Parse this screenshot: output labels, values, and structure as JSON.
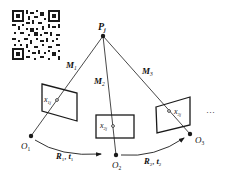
{
  "diagram": {
    "type": "multi-view-geometry",
    "point": {
      "label": "P",
      "sub": "j"
    },
    "projection_labels": [
      {
        "label": "M",
        "sub": "1"
      },
      {
        "label": "M",
        "sub": "2"
      },
      {
        "label": "M",
        "sub": "3"
      }
    ],
    "cameras": [
      {
        "label": "O",
        "sub": "1"
      },
      {
        "label": "O",
        "sub": "2"
      },
      {
        "label": "O",
        "sub": "3"
      }
    ],
    "image_points": [
      {
        "label": "x",
        "sub": "1j"
      },
      {
        "label": "x",
        "sub": "2j"
      },
      {
        "label": "x",
        "sub": "3j"
      }
    ],
    "motions": [
      {
        "r": "R",
        "r_sub": "1",
        "t": "t",
        "t_sub": "1",
        "sep": ", "
      },
      {
        "r": "R",
        "r_sub": "2",
        "t": "t",
        "t_sub": "2",
        "sep": ", "
      }
    ],
    "ellipsis": "…",
    "qr_code": "qr-code"
  },
  "colors": {
    "line": "#1a1a1a",
    "background": "#ffffff"
  }
}
